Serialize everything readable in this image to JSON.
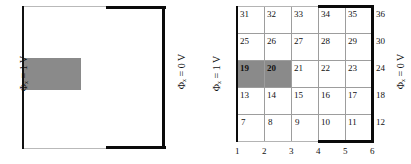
{
  "figure": {
    "type": "diagram"
  },
  "left_panel": {
    "label_left": "Φₓ = 1 V",
    "label_right": "Φₓ = 0 V",
    "filled_region": {
      "name": "shaded-block",
      "fill_color": "#8a8a8a"
    },
    "boundary": {
      "thick_color": "#0a0a0a",
      "thin_color": "#b9b9b9"
    }
  },
  "right_panel": {
    "label_left": "Φₓ = 1 V",
    "label_right": "Φₓ = 0 V",
    "grid": {
      "columns": 6,
      "rows": 6,
      "line_color": "#9d9d9d",
      "thick_color": "#0a0a0a"
    },
    "node_rows": [
      [
        "31",
        "32",
        "33",
        "34",
        "35",
        "36"
      ],
      [
        "25",
        "26",
        "27",
        "28",
        "29",
        "30"
      ],
      [
        "19",
        "20",
        "21",
        "22",
        "23",
        "24"
      ],
      [
        "13",
        "14",
        "15",
        "16",
        "17",
        "18"
      ],
      [
        "7",
        "8",
        "9",
        "10",
        "11",
        "12"
      ]
    ],
    "bottom_axis": [
      "1",
      "2",
      "3",
      "4",
      "5",
      "6"
    ],
    "highlighted_nodes": [
      "19",
      "20"
    ],
    "highlight_color": "#8a8a8a"
  }
}
